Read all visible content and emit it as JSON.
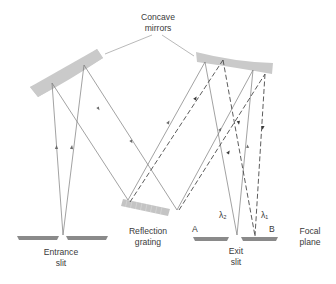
{
  "diagram": {
    "type": "monochromator optical path",
    "labels": {
      "concave_mirrors": [
        "Concave",
        "mirrors"
      ],
      "reflection_grating": [
        "Reflection",
        "grating"
      ],
      "entrance_slit": [
        "Entrance",
        "slit"
      ],
      "exit_slit": [
        "Exit",
        "slit"
      ],
      "focal_plane": [
        "Focal",
        "plane"
      ],
      "point_a": "A",
      "point_b": "B",
      "lambda_1": "λ₁",
      "lambda_2": "λ₂"
    },
    "colors": {
      "mirror_fill": "#c8c8c8",
      "grating_fill": "#c4c4c4",
      "slit_fill": "#8a8a8a",
      "ray_stroke": "#7a7a7a",
      "dashed_ray_stroke": "#4a4a4a",
      "text": "#3a3a3a"
    }
  }
}
